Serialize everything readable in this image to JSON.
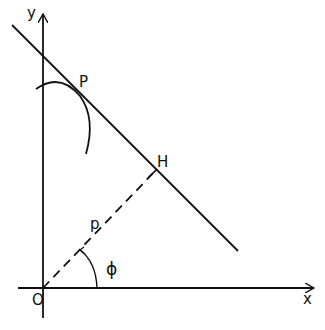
{
  "diagram": {
    "labels": {
      "y_axis": "y",
      "x_axis": "x",
      "origin": "O",
      "point_p": "P",
      "foot_h": "H",
      "distance": "p",
      "angle": "ϕ"
    },
    "colors": {
      "ink": "#111111",
      "background": "#ffffff"
    }
  }
}
